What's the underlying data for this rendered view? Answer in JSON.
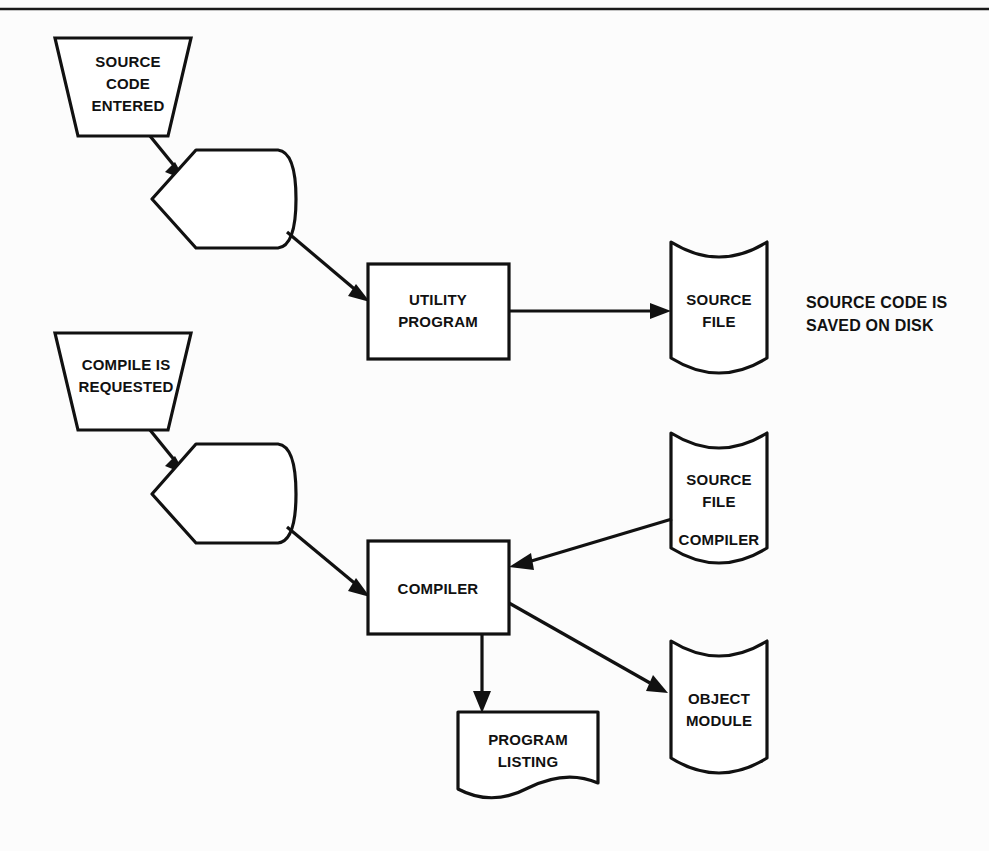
{
  "page": {
    "background_color": "#fcfcfc",
    "line_color": "#111111",
    "shape_fill": "#ffffff",
    "width": 989,
    "height": 851
  },
  "divider": {
    "name": "top-horizontal-rule"
  },
  "nodes": {
    "source_code_entered": {
      "shape": "trapezoid-manual-input",
      "line1": "SOURCE",
      "line2": "CODE",
      "line3": "ENTERED"
    },
    "process_display_top": {
      "shape": "display",
      "label": ""
    },
    "utility_program": {
      "shape": "rectangle-process",
      "line1": "UTILITY",
      "line2": "PROGRAM"
    },
    "source_file_disk": {
      "shape": "stored-data-drum",
      "line1": "SOURCE",
      "line2": "FILE"
    },
    "compile_is_requested": {
      "shape": "trapezoid-manual-input",
      "line1": "COMPILE IS",
      "line2": "REQUESTED"
    },
    "process_display_bottom": {
      "shape": "display",
      "label": ""
    },
    "compiler": {
      "shape": "rectangle-process",
      "line1": "COMPILER"
    },
    "source_file_compiler_disk": {
      "shape": "stored-data-drum",
      "line1": "SOURCE",
      "line2": "FILE",
      "line3": "COMPILER"
    },
    "object_module_disk": {
      "shape": "stored-data-drum",
      "line1": "OBJECT",
      "line2": "MODULE"
    },
    "program_listing_document": {
      "shape": "document-wavy",
      "line1": "PROGRAM",
      "line2": "LISTING"
    }
  },
  "annotations": {
    "source_code_saved": {
      "line1": "SOURCE CODE IS",
      "line2": "SAVED ON DISK"
    }
  },
  "connectors": [
    {
      "name": "source-code-to-display",
      "from": "source_code_entered",
      "to": "process_display_top",
      "style": "arrow"
    },
    {
      "name": "display-to-utility-program",
      "from": "process_display_top",
      "to": "utility_program",
      "style": "arrow"
    },
    {
      "name": "utility-program-to-source-file",
      "from": "utility_program",
      "to": "source_file_disk",
      "style": "arrow"
    },
    {
      "name": "compile-request-to-display",
      "from": "compile_is_requested",
      "to": "process_display_bottom",
      "style": "arrow"
    },
    {
      "name": "display-to-compiler",
      "from": "process_display_bottom",
      "to": "compiler",
      "style": "arrow"
    },
    {
      "name": "source-file-compiler-to-compiler",
      "from": "source_file_compiler_disk",
      "to": "compiler",
      "style": "arrow"
    },
    {
      "name": "compiler-to-object-module",
      "from": "compiler",
      "to": "object_module_disk",
      "style": "arrow"
    },
    {
      "name": "compiler-to-program-listing",
      "from": "compiler",
      "to": "program_listing_document",
      "style": "arrow"
    }
  ]
}
